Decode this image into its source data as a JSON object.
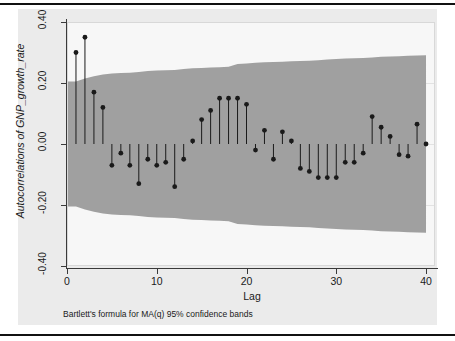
{
  "figure": {
    "background_color": "#ebebeb",
    "plot_background_color": "#f7f7f7",
    "band_color": "#a0a0a0",
    "marker_color": "#1a1a1a",
    "stem_color": "#1a1a1a"
  },
  "axis": {
    "y_title": "Autocorrelations of GNP_growth_rate",
    "x_title": "Lag",
    "y_ticks": [
      "0.40",
      "0.20",
      "0.00",
      "-0.20",
      "-0.40"
    ],
    "x_ticks": [
      "0",
      "10",
      "20",
      "30",
      "40"
    ]
  },
  "caption": {
    "note": "Bartlett's formula for MA(q) 95% confidence bands"
  },
  "chart_data": {
    "type": "bar",
    "title": "",
    "subtitle": "",
    "xlabel": "Lag",
    "ylabel": "Autocorrelations of GNP_growth_rate",
    "xlim": [
      0,
      41
    ],
    "ylim": [
      -0.4,
      0.4
    ],
    "yticks": [
      0.4,
      0.2,
      0.0,
      -0.2,
      -0.4
    ],
    "xticks": [
      0,
      10,
      20,
      30,
      40
    ],
    "grid": true,
    "legend": null,
    "annotation": "Bartlett's formula for MA(q) 95% confidence bands",
    "categories": [
      1,
      2,
      3,
      4,
      5,
      6,
      7,
      8,
      9,
      10,
      11,
      12,
      13,
      14,
      15,
      16,
      17,
      18,
      19,
      20,
      21,
      22,
      23,
      24,
      25,
      26,
      27,
      28,
      29,
      30,
      31,
      32,
      33,
      34,
      35,
      36,
      37,
      38,
      39,
      40
    ],
    "values": [
      0.3,
      0.35,
      0.17,
      0.12,
      -0.07,
      -0.03,
      -0.07,
      -0.13,
      -0.05,
      -0.07,
      -0.06,
      -0.14,
      -0.05,
      0.01,
      0.08,
      0.11,
      0.15,
      0.15,
      0.15,
      0.13,
      -0.02,
      0.045,
      -0.05,
      0.04,
      0.01,
      -0.08,
      -0.09,
      -0.11,
      -0.11,
      -0.11,
      -0.06,
      -0.06,
      -0.03,
      0.09,
      0.055,
      0.025,
      -0.035,
      -0.04,
      0.065,
      0.0
    ],
    "series": [
      {
        "name": "Autocorrelation",
        "values": [
          0.3,
          0.35,
          0.17,
          0.12,
          -0.07,
          -0.03,
          -0.07,
          -0.13,
          -0.05,
          -0.07,
          -0.06,
          -0.14,
          -0.05,
          0.01,
          0.08,
          0.11,
          0.15,
          0.15,
          0.15,
          0.13,
          -0.02,
          0.045,
          -0.05,
          0.04,
          0.01,
          -0.08,
          -0.09,
          -0.11,
          -0.11,
          -0.11,
          -0.06,
          -0.06,
          -0.03,
          0.09,
          0.055,
          0.025,
          -0.035,
          -0.04,
          0.065,
          0.0
        ]
      }
    ],
    "confidence_band": {
      "label": "Bartlett 95% confidence band",
      "color": "#a0a0a0",
      "x": [
        0,
        1,
        2,
        3,
        4,
        5,
        6,
        7,
        8,
        9,
        10,
        11,
        12,
        13,
        14,
        15,
        16,
        17,
        18,
        19,
        20,
        21,
        22,
        23,
        24,
        25,
        26,
        27,
        28,
        29,
        30,
        31,
        32,
        33,
        34,
        35,
        36,
        37,
        38,
        39,
        40
      ],
      "upper": [
        0.205,
        0.205,
        0.215,
        0.222,
        0.228,
        0.231,
        0.233,
        0.234,
        0.236,
        0.239,
        0.241,
        0.242,
        0.243,
        0.246,
        0.248,
        0.249,
        0.251,
        0.252,
        0.253,
        0.262,
        0.264,
        0.266,
        0.268,
        0.269,
        0.27,
        0.271,
        0.272,
        0.273,
        0.275,
        0.277,
        0.279,
        0.28,
        0.281,
        0.282,
        0.284,
        0.286,
        0.287,
        0.288,
        0.289,
        0.29,
        0.291
      ],
      "lower": [
        -0.205,
        -0.205,
        -0.215,
        -0.222,
        -0.228,
        -0.231,
        -0.233,
        -0.234,
        -0.236,
        -0.239,
        -0.241,
        -0.242,
        -0.243,
        -0.246,
        -0.248,
        -0.249,
        -0.251,
        -0.252,
        -0.253,
        -0.262,
        -0.264,
        -0.266,
        -0.268,
        -0.269,
        -0.27,
        -0.271,
        -0.272,
        -0.273,
        -0.275,
        -0.277,
        -0.279,
        -0.28,
        -0.281,
        -0.282,
        -0.284,
        -0.286,
        -0.287,
        -0.288,
        -0.289,
        -0.29,
        -0.291
      ]
    }
  }
}
